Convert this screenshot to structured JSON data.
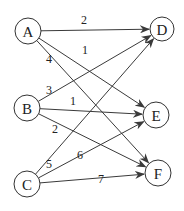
{
  "diagram": {
    "type": "bipartite-directed-graph",
    "background": "#ffffff",
    "line_color": "#3a3a3a",
    "nodes": [
      {
        "id": "A",
        "label": "A",
        "x": 28,
        "y": 31,
        "r": 13
      },
      {
        "id": "B",
        "label": "B",
        "x": 27,
        "y": 108,
        "r": 13
      },
      {
        "id": "C",
        "label": "C",
        "x": 27,
        "y": 184,
        "r": 13
      },
      {
        "id": "D",
        "label": "D",
        "x": 162,
        "y": 29,
        "r": 12
      },
      {
        "id": "E",
        "label": "E",
        "x": 156,
        "y": 115,
        "r": 13
      },
      {
        "id": "F",
        "label": "F",
        "x": 158,
        "y": 173,
        "r": 13
      }
    ],
    "edges": [
      {
        "from": "A",
        "to": "D",
        "weight": "2",
        "label_x": 84,
        "label_y": 20
      },
      {
        "from": "A",
        "to": "E",
        "weight": "1",
        "label_x": 85,
        "label_y": 50
      },
      {
        "from": "A",
        "to": "F",
        "weight": "4",
        "label_x": 49,
        "label_y": 59
      },
      {
        "from": "B",
        "to": "D",
        "weight": "3",
        "label_x": 49,
        "label_y": 90
      },
      {
        "from": "B",
        "to": "E",
        "weight": "1",
        "label_x": 73,
        "label_y": 101
      },
      {
        "from": "B",
        "to": "F",
        "weight": "2",
        "label_x": 55,
        "label_y": 129
      },
      {
        "from": "C",
        "to": "D",
        "weight": "5",
        "label_x": 49,
        "label_y": 164
      },
      {
        "from": "C",
        "to": "E",
        "weight": "6",
        "label_x": 80,
        "label_y": 155
      },
      {
        "from": "C",
        "to": "F",
        "weight": "7",
        "label_x": 101,
        "label_y": 179
      }
    ]
  }
}
